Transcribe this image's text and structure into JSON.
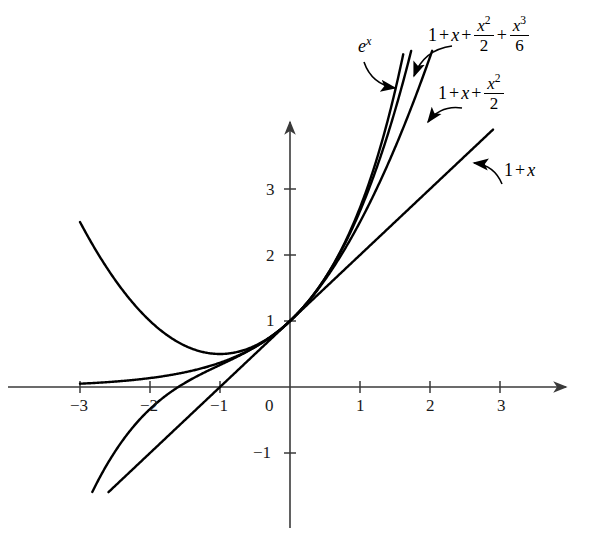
{
  "chart_data": {
    "type": "line",
    "title": "",
    "xlabel": "",
    "ylabel": "",
    "xlim": [
      -3.35,
      3.9
    ],
    "ylim": [
      -1.6,
      5.1
    ],
    "grid": false,
    "legend_position": "inline-annotations",
    "x_ticks": [
      -3,
      -2,
      -1,
      0,
      1,
      2,
      3
    ],
    "x_tick_labels": [
      "−3",
      "−2",
      "−1",
      "0",
      "1",
      "2",
      "3"
    ],
    "y_ticks": [
      -1,
      1,
      2,
      3
    ],
    "y_tick_labels": [
      "−1",
      "1",
      "2",
      "3"
    ],
    "common_point": {
      "x": 0,
      "y": 1
    },
    "series": [
      {
        "name": "e^x",
        "label_text": "e",
        "label_exponent": "x",
        "expression": "exp(x)",
        "x_domain": [
          -3.0,
          2.27
        ],
        "points_x": [
          -3,
          -2.5,
          -2,
          -1.5,
          -1,
          -0.5,
          0,
          0.5,
          1,
          1.5,
          2,
          2.27
        ],
        "points_y": [
          0.0498,
          0.0821,
          0.1353,
          0.2231,
          0.3679,
          0.6065,
          1,
          1.6487,
          2.7183,
          4.4817,
          7.389,
          9.68
        ]
      },
      {
        "name": "1 + x + x^2/2 + x^3/6",
        "expression": "1 + x + x^2/2 + x^3/6",
        "x_domain": [
          -3.0,
          2.27
        ],
        "points_x": [
          -3,
          -2.5,
          -2,
          -1.5,
          -1,
          -0.5,
          0,
          0.5,
          1,
          1.5,
          2,
          2.27
        ],
        "points_y": [
          -2.0,
          -1.23,
          -0.667,
          -0.25,
          0.3333,
          0.6042,
          1,
          1.6458,
          2.6667,
          4.1875,
          6.3333,
          7.66
        ]
      },
      {
        "name": "1 + x + x^2/2",
        "expression": "1 + x + x^2/2",
        "x_domain": [
          -3.0,
          2.46
        ],
        "points_x": [
          -3,
          -2.5,
          -2,
          -1.5,
          -1,
          -0.5,
          0,
          0.5,
          1,
          1.5,
          2,
          2.46
        ],
        "points_y": [
          2.5,
          1.625,
          1.0,
          0.625,
          0.5,
          0.625,
          1,
          1.625,
          2.5,
          3.625,
          5.0,
          6.486
        ]
      },
      {
        "name": "1 + x",
        "expression": "1 + x",
        "x_domain": [
          -3.0,
          2.9
        ],
        "points_x": [
          -3,
          2.9
        ],
        "points_y": [
          -2.0,
          3.9
        ]
      }
    ],
    "annotations": [
      {
        "id": "label-ex",
        "text": "e^x",
        "target_series": "e^x",
        "label_position": {
          "x": 358,
          "y": 42
        },
        "arrow_from": {
          "x": 364,
          "y": 62
        },
        "arrow_to": {
          "x": 395,
          "y": 88
        }
      },
      {
        "id": "label-cubic",
        "text": "1 + x + x^2/2 + x^3/6",
        "target_series": "1 + x + x^2/2 + x^3/6",
        "label_position": {
          "x": 430,
          "y": 20
        },
        "arrow_from": {
          "x": 452,
          "y": 46
        },
        "arrow_to": {
          "x": 414,
          "y": 76
        }
      },
      {
        "id": "label-quadratic",
        "text": "1 + x + x^2/2",
        "target_series": "1 + x + x^2/2",
        "label_position": {
          "x": 440,
          "y": 78
        },
        "arrow_from": {
          "x": 462,
          "y": 108
        },
        "arrow_to": {
          "x": 428,
          "y": 122
        }
      },
      {
        "id": "label-linear",
        "text": "1 + x",
        "target_series": "1 + x",
        "label_position": {
          "x": 505,
          "y": 168
        },
        "arrow_from": {
          "x": 502,
          "y": 184
        },
        "arrow_to": {
          "x": 474,
          "y": 163
        }
      }
    ],
    "axes": {
      "origin_px": {
        "x": 290,
        "y": 387
      },
      "x_unit_px": 70,
      "y_unit_px": 66,
      "x_axis_left_px": 8,
      "x_axis_right_px": 566,
      "y_axis_top_px": 122,
      "y_axis_bottom_px": 528,
      "axis_color": "#3a3a3a",
      "curve_color": "#000000",
      "background": "#ffffff"
    }
  }
}
